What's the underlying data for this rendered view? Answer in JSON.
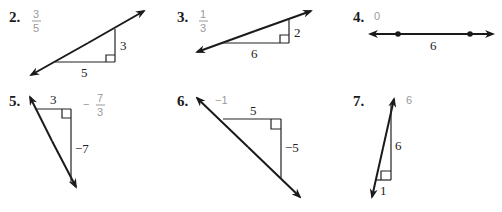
{
  "problems": [
    {
      "number": "2.",
      "answer": {
        "type": "fraction",
        "numerator": "3",
        "denominator": "5"
      },
      "rise_label": "3",
      "run_label": "5"
    },
    {
      "number": "3.",
      "answer": {
        "type": "fraction",
        "numerator": "1",
        "denominator": "3"
      },
      "rise_label": "2",
      "run_label": "6"
    },
    {
      "number": "4.",
      "answer": {
        "type": "value",
        "text": "0"
      },
      "run_label": "6"
    },
    {
      "number": "5.",
      "answer": {
        "type": "fraction",
        "sign": "−",
        "numerator": "7",
        "denominator": "3"
      },
      "run_label": "3",
      "rise_label": "−7"
    },
    {
      "number": "6.",
      "answer": {
        "type": "value",
        "text": "−1"
      },
      "run_label": "5",
      "rise_label": "−5"
    },
    {
      "number": "7.",
      "answer": {
        "type": "value",
        "text": "6"
      },
      "rise_label": "6",
      "run_label": "1"
    }
  ],
  "colors": {
    "ink": "#1a1a1a",
    "answer": "#9a9a9a"
  }
}
